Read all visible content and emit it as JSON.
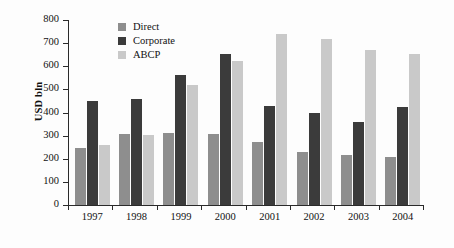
{
  "chart_data": {
    "type": "bar",
    "title": "",
    "xlabel": "",
    "ylabel": "USD bln",
    "categories": [
      "1997",
      "1998",
      "1999",
      "2000",
      "2001",
      "2002",
      "2003",
      "2004"
    ],
    "series": [
      {
        "name": "Direct",
        "color": "#8e8e8e",
        "values": [
          248,
          306,
          312,
          309,
          272,
          228,
          215,
          209
        ]
      },
      {
        "name": "Corporate",
        "color": "#3b3b3b",
        "values": [
          451,
          460,
          564,
          654,
          427,
          396,
          361,
          424
        ]
      },
      {
        "name": "ABCP",
        "color": "#c9c9c9",
        "values": [
          259,
          304,
          520,
          624,
          740,
          716,
          669,
          652
        ]
      }
    ],
    "ylim": [
      0,
      800
    ],
    "yticks": [
      0,
      100,
      200,
      300,
      400,
      500,
      600,
      700,
      800
    ],
    "ytick_labels": [
      "0",
      "100",
      "200",
      "300",
      "400",
      "500",
      "600",
      "700",
      "800"
    ],
    "grid": false,
    "legend_position": "top-left-inside"
  }
}
